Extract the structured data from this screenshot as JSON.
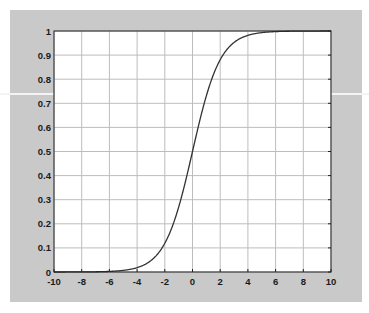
{
  "chart_data": {
    "type": "line",
    "title": "",
    "xlabel": "",
    "ylabel": "",
    "xlim": [
      -10,
      10
    ],
    "ylim": [
      0,
      1
    ],
    "grid": true,
    "legend": null,
    "x_ticks": [
      "-10",
      "-8",
      "-6",
      "-4",
      "-2",
      "0",
      "2",
      "4",
      "6",
      "8",
      "10"
    ],
    "y_ticks": [
      "0",
      "0.1",
      "0.2",
      "0.3",
      "0.4",
      "0.5",
      "0.6",
      "0.7",
      "0.8",
      "0.9",
      "1"
    ],
    "series": [
      {
        "name": "sigmoid 1/(1+e^-x)",
        "color": "#333333",
        "x": [
          -10,
          -8,
          -6,
          -5,
          -4,
          -3,
          -2,
          -1,
          0,
          1,
          2,
          3,
          4,
          5,
          6,
          8,
          10
        ],
        "y": [
          0.0,
          0.0003,
          0.0025,
          0.0067,
          0.018,
          0.0474,
          0.1192,
          0.2689,
          0.5,
          0.7311,
          0.8808,
          0.9526,
          0.982,
          0.9933,
          0.9975,
          0.9997,
          1.0
        ]
      }
    ]
  },
  "colors": {
    "frame": "#c9c9c9",
    "plot_bg": "#ffffff",
    "grid": "#bdbdbd",
    "axis": "#222222",
    "curve": "#333333"
  }
}
